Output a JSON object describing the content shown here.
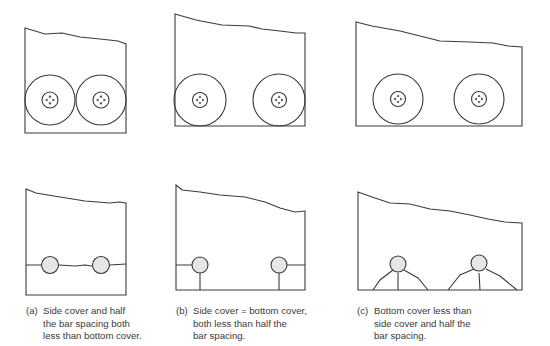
{
  "figure": {
    "stroke_color": "#3a3a3a",
    "bar_fill_color": "#e6e6e6",
    "panels": [
      {
        "id": "a",
        "label": "(a)",
        "caption": "Side cover and half\nthe bar spacing both\nless than bottom cover.",
        "top_diagram": "two large cover circles touching each other and the bottom",
        "bottom_diagram": "horizontal splitting crack through both bars"
      },
      {
        "id": "b",
        "label": "(b)",
        "caption": "Side cover = bottom cover,\nboth less than half the\nbar spacing.",
        "top_diagram": "cover circles touching sides and bottom, gap between bars",
        "bottom_diagram": "side cracks and vertical cracks to bottom"
      },
      {
        "id": "c",
        "label": "(c)",
        "caption": "Bottom cover less than\nside cover and half the\nbar spacing.",
        "top_diagram": "cover circles touching bottom only",
        "bottom_diagram": "V-notch cracks below each bar"
      }
    ]
  }
}
